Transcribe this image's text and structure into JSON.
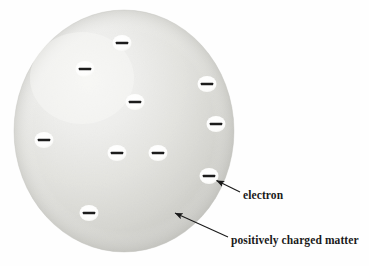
{
  "figure": {
    "background_color": "#fefefe"
  },
  "sphere": {
    "name": "positively charged matter sphere",
    "center_x": 124,
    "center_y": 131,
    "radius_x": 110,
    "radius_y": 121,
    "fill_light": "#f2f2f0",
    "fill_mid": "#dededa",
    "fill_dark": "#c9c9c4",
    "highlight_x": 80,
    "highlight_y": 80
  },
  "electrons": {
    "symbol": "−",
    "count": 10,
    "circle_fill": "#ffffff",
    "bar_color": "#1c1c1c",
    "positions": [
      {
        "id": "electron-1",
        "cx": 122,
        "cy": 43,
        "rx": 9.5,
        "ry": 8.0
      },
      {
        "id": "electron-2",
        "cx": 85,
        "cy": 69,
        "rx": 9.5,
        "ry": 8.0
      },
      {
        "id": "electron-3",
        "cx": 207,
        "cy": 84,
        "rx": 9.5,
        "ry": 8.0
      },
      {
        "id": "electron-4",
        "cx": 135,
        "cy": 102,
        "rx": 9.5,
        "ry": 8.0
      },
      {
        "id": "electron-5",
        "cx": 216,
        "cy": 124,
        "rx": 9.5,
        "ry": 8.0
      },
      {
        "id": "electron-6",
        "cx": 44,
        "cy": 140,
        "rx": 9.5,
        "ry": 8.0
      },
      {
        "id": "electron-7",
        "cx": 117,
        "cy": 153,
        "rx": 9.5,
        "ry": 8.0
      },
      {
        "id": "electron-8",
        "cx": 158,
        "cy": 153,
        "rx": 9.5,
        "ry": 8.0
      },
      {
        "id": "electron-9",
        "cx": 209,
        "cy": 176,
        "rx": 9.5,
        "ry": 8.0
      },
      {
        "id": "electron-10",
        "cx": 89,
        "cy": 213,
        "rx": 9.5,
        "ry": 8.0
      }
    ]
  },
  "annotations": {
    "electron": {
      "label": "electron",
      "arrow_from_x": 240,
      "arrow_from_y": 192,
      "arrow_to_x": 215,
      "arrow_to_y": 180
    },
    "matter": {
      "label": "positively charged matter",
      "arrow_from_x": 228,
      "arrow_from_y": 237,
      "arrow_to_x": 173,
      "arrow_to_y": 212
    },
    "arrow_color": "#1a1a1a"
  }
}
